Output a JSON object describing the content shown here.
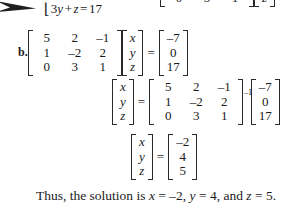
{
  "page": {
    "background": "#ffffff",
    "ink_color": "#1a1a1a"
  },
  "pointer": {
    "icon": "arrow-right-icon"
  },
  "top_equation": {
    "brace": "⎣",
    "text": "3y + z = 17",
    "coefficient": "3",
    "var1": "y",
    "plus": "+",
    "var2": "z",
    "equals": "=",
    "rhs": "17"
  },
  "top_matrix_row": {
    "coefficient_row": [
      "0",
      "3",
      "1"
    ],
    "variable_row": [
      "z"
    ]
  },
  "part_b": {
    "label": "b.",
    "coefficient_matrix": [
      [
        "5",
        "2",
        "–1"
      ],
      [
        "1",
        "–2",
        "2"
      ],
      [
        "0",
        "3",
        "1"
      ]
    ],
    "variable_vector": [
      "x",
      "y",
      "z"
    ],
    "equals": "=",
    "constant_vector": [
      "–7",
      "0",
      "17"
    ]
  },
  "inverse_step": {
    "variable_vector": [
      "x",
      "y",
      "z"
    ],
    "equals": "=",
    "coefficient_matrix": [
      [
        "5",
        "2",
        "–1"
      ],
      [
        "1",
        "–2",
        "2"
      ],
      [
        "0",
        "3",
        "1"
      ]
    ],
    "inverse_exponent": "–1",
    "constant_vector": [
      "–7",
      "0",
      "17"
    ]
  },
  "result_step": {
    "variable_vector": [
      "x",
      "y",
      "z"
    ],
    "equals": "=",
    "solution_vector": [
      "–2",
      "4",
      "5"
    ]
  },
  "conclusion": {
    "lead": "Thus, the solution is ",
    "x_var": "x",
    "x_eq": " = ",
    "x_val": "–2",
    "sep1": ", ",
    "y_var": "y",
    "y_eq": " = ",
    "y_val": "4",
    "sep2": ", and ",
    "z_var": "z",
    "z_eq": " = ",
    "z_val": "5",
    "period": "."
  }
}
